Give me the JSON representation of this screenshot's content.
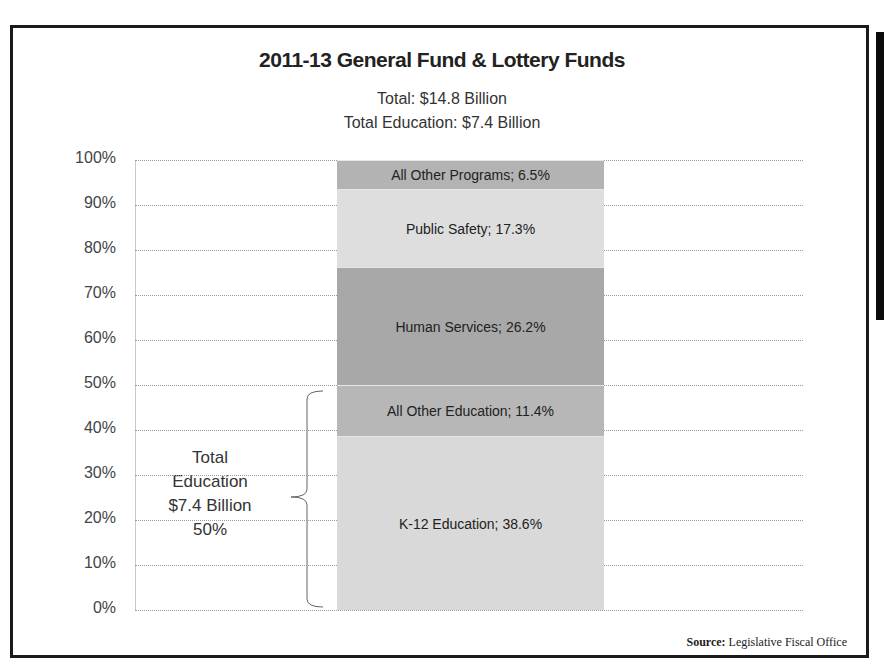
{
  "header": {
    "title": "2011-13 General Fund & Lottery Funds",
    "subtitle_total": "Total: $14.8 Billion",
    "subtitle_education": "Total Education: $7.4 Billion"
  },
  "y_axis": {
    "ticks": [
      "100%",
      "90%",
      "80%",
      "70%",
      "60%",
      "50%",
      "40%",
      "30%",
      "20%",
      "10%",
      "0%"
    ]
  },
  "segments": [
    {
      "name": "K-12 Education",
      "value": 38.6,
      "label": "K-12 Education; 38.6%",
      "color": "#d9d9d9"
    },
    {
      "name": "All Other Education",
      "value": 11.4,
      "label": "All Other Education; 11.4%",
      "color": "#b7b7b7"
    },
    {
      "name": "Human Services",
      "value": 26.2,
      "label": "Human Services; 26.2%",
      "color": "#a8a8a8"
    },
    {
      "name": "Public Safety",
      "value": 17.3,
      "label": "Public Safety; 17.3%",
      "color": "#dedede"
    },
    {
      "name": "All Other Programs",
      "value": 6.5,
      "label": "All Other Programs; 6.5%",
      "color": "#b3b3b3"
    }
  ],
  "annotation": {
    "line1": "Total",
    "line2": "Education",
    "line3": "$7.4 Billion",
    "line4": "50%"
  },
  "source": {
    "label": "Source:",
    "text": " Legislative Fiscal Office"
  },
  "chart_data": {
    "type": "bar",
    "stacked": true,
    "title": "2011-13 General Fund & Lottery Funds",
    "subtitle": [
      "Total: $14.8 Billion",
      "Total Education: $7.4 Billion"
    ],
    "categories": [
      "2011-13"
    ],
    "series": [
      {
        "name": "K-12 Education",
        "values": [
          38.6
        ]
      },
      {
        "name": "All Other Education",
        "values": [
          11.4
        ]
      },
      {
        "name": "Human Services",
        "values": [
          26.2
        ]
      },
      {
        "name": "Public Safety",
        "values": [
          17.3
        ]
      },
      {
        "name": "All Other Programs",
        "values": [
          6.5
        ]
      }
    ],
    "xlabel": "",
    "ylabel": "",
    "ylim": [
      0,
      100
    ],
    "y_tick_format": "percent",
    "y_ticks": [
      0,
      10,
      20,
      30,
      40,
      50,
      60,
      70,
      80,
      90,
      100
    ],
    "grid": true,
    "legend": "none (data labels inside segments)",
    "annotations": [
      {
        "text": "Total Education $7.4 Billion 50%",
        "spans": [
          "K-12 Education",
          "All Other Education"
        ],
        "type": "brace"
      }
    ],
    "source": "Source: Legislative Fiscal Office"
  }
}
